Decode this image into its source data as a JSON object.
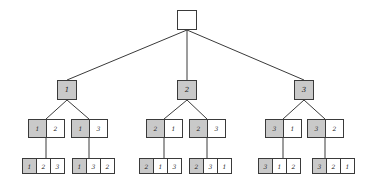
{
  "diagram": {
    "type": "permutation-tree",
    "colors": {
      "highlight": "#c9c9c9",
      "border": "#3a3a3a",
      "edge": "#3a3a3a"
    },
    "root": {
      "cells": [
        ""
      ]
    },
    "level1": [
      {
        "cells": [
          "1"
        ]
      },
      {
        "cells": [
          "2"
        ]
      },
      {
        "cells": [
          "3"
        ]
      }
    ],
    "level2": [
      {
        "cells": [
          "1",
          "2"
        ]
      },
      {
        "cells": [
          "1",
          "3"
        ]
      },
      {
        "cells": [
          "2",
          "1"
        ]
      },
      {
        "cells": [
          "2",
          "3"
        ]
      },
      {
        "cells": [
          "3",
          "1"
        ]
      },
      {
        "cells": [
          "3",
          "2"
        ]
      }
    ],
    "level3": [
      {
        "cells": [
          "1",
          "2",
          "3"
        ]
      },
      {
        "cells": [
          "1",
          "3",
          "2"
        ]
      },
      {
        "cells": [
          "2",
          "1",
          "3"
        ]
      },
      {
        "cells": [
          "2",
          "3",
          "1"
        ]
      },
      {
        "cells": [
          "3",
          "1",
          "2"
        ]
      },
      {
        "cells": [
          "3",
          "2",
          "1"
        ]
      }
    ]
  }
}
